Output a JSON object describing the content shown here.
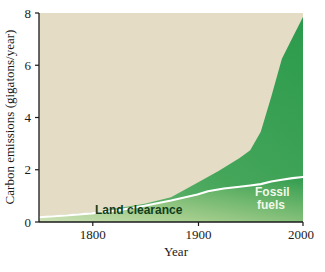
{
  "chart_data": {
    "type": "area",
    "title": "",
    "xlabel": "Year",
    "ylabel": "Carbon emissions (gigatons/year)",
    "xlim": [
      1750,
      2000
    ],
    "ylim": [
      0,
      8
    ],
    "xticks": [
      1800,
      1900,
      2000
    ],
    "yticks": [
      0,
      2,
      4,
      6,
      8
    ],
    "grid": false,
    "legend_position": "inline-annotations",
    "colors": {
      "background": "#ffffff",
      "plot_background": "#e4dcc4",
      "fossil_fuels_fill": "#2f9b4e",
      "land_clearance_fill": "#a8ce8f",
      "boundary_line": "#ffffff",
      "axis": "#1a1a1a"
    },
    "annotations": [
      {
        "name": "land-clearance-label",
        "text": "Land clearance",
        "x": 1835,
        "y": 0.55
      },
      {
        "name": "fossil-fuels-label",
        "text": "Fossil fuels",
        "x": 1975,
        "y": 1.35
      }
    ],
    "series": [
      {
        "name": "Land clearance",
        "stack_order": 1,
        "x": [
          1750,
          1775,
          1800,
          1825,
          1850,
          1875,
          1900,
          1910,
          1925,
          1940,
          1950,
          1960,
          1970,
          1980,
          1990,
          2000
        ],
        "values": [
          0.18,
          0.25,
          0.33,
          0.45,
          0.62,
          0.82,
          1.05,
          1.18,
          1.28,
          1.35,
          1.4,
          1.45,
          1.55,
          1.62,
          1.68,
          1.72
        ]
      },
      {
        "name": "Fossil fuels",
        "stack_order": 2,
        "x": [
          1750,
          1800,
          1850,
          1870,
          1880,
          1890,
          1900,
          1910,
          1915,
          1920,
          1925,
          1930,
          1932,
          1935,
          1940,
          1945,
          1950,
          1955,
          1960,
          1965,
          1970,
          1975,
          1978,
          1980,
          1983,
          1985,
          1990,
          1995,
          2000
        ],
        "values": [
          0.0,
          0.01,
          0.05,
          0.1,
          0.16,
          0.25,
          0.4,
          0.62,
          0.7,
          0.78,
          0.92,
          1.0,
          0.82,
          0.9,
          1.1,
          1.05,
          1.32,
          1.6,
          1.95,
          2.4,
          3.2,
          3.9,
          4.45,
          4.6,
          4.35,
          4.55,
          5.3,
          5.7,
          6.15
        ]
      }
    ],
    "total_top": {
      "name": "Total emissions",
      "x": [
        1750,
        1800,
        1850,
        1875,
        1900,
        1920,
        1930,
        1940,
        1950,
        1960,
        1970,
        1980,
        1990,
        2000
      ],
      "values": [
        0.2,
        0.36,
        0.7,
        0.95,
        1.5,
        1.95,
        2.2,
        2.45,
        2.75,
        3.45,
        4.8,
        6.25,
        7.05,
        7.85
      ]
    }
  },
  "axes": {
    "ylabel": "Carbon emissions (gigatons/year)",
    "xlabel": "Year",
    "ytick_labels": [
      "8",
      "6",
      "4",
      "2",
      "0"
    ],
    "xtick_labels": [
      "1800",
      "1900",
      "2000"
    ]
  },
  "labels": {
    "land_clearance": "Land clearance",
    "fossil_fuels_line1": "Fossil",
    "fossil_fuels_line2": "fuels"
  }
}
